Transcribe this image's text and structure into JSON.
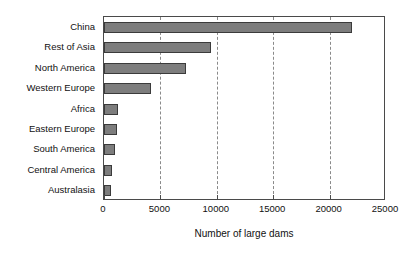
{
  "chart_data": {
    "type": "bar",
    "orientation": "horizontal",
    "title": "",
    "xlabel": "Number of large dams",
    "ylabel": "",
    "xlim": [
      0,
      25000
    ],
    "xticks": [
      0,
      5000,
      10000,
      15000,
      20000,
      25000
    ],
    "xtick_labels": [
      "0",
      "5000",
      "10000",
      "15000",
      "20000",
      "25000"
    ],
    "grid": "vertical-dashed",
    "legend": "none",
    "bar_color": "#7d7d7d",
    "bar_edge_color": "#3b3b3b",
    "frame_color": "#4a4a4a",
    "categories": [
      "China",
      "Rest of Asia",
      "North America",
      "Western Europe",
      "Africa",
      "Eastern Europe",
      "South America",
      "Central America",
      "Australasia"
    ],
    "values": [
      22000,
      9500,
      7300,
      4200,
      1200,
      1150,
      1000,
      750,
      650
    ]
  }
}
